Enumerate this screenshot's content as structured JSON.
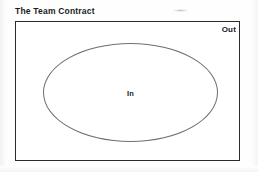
{
  "page": {
    "title": "The Team Contract",
    "background_color": "#fefefe"
  },
  "diagram": {
    "type": "venn-boundary",
    "border_color": "#2c2c2c",
    "ellipse_color": "#6f6f6f",
    "outer_region_label": "Out",
    "inner_region_label": "In"
  },
  "artifacts": {
    "smudge_present": true
  }
}
